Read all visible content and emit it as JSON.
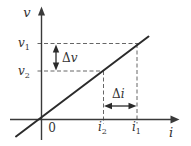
{
  "figure": {
    "colors": {
      "line": "#2b2b2b",
      "axis": "#3a3a3a",
      "dashed": "#666666",
      "text": "#333333"
    },
    "axis": {
      "y_label": "v",
      "x_label": "i",
      "origin": "0"
    },
    "points": {
      "v1": {
        "base": "v",
        "sub": "1"
      },
      "v2": {
        "base": "v",
        "sub": "2"
      },
      "i1": {
        "base": "i",
        "sub": "1"
      },
      "i2": {
        "base": "i",
        "sub": "2"
      }
    },
    "deltas": {
      "dv": {
        "delta": "Δ",
        "var": "v"
      },
      "di": {
        "delta": "Δ",
        "var": "i"
      }
    }
  }
}
